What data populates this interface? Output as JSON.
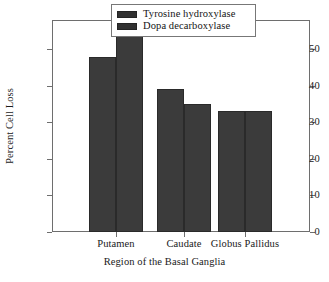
{
  "chart_data": {
    "type": "bar",
    "title": "",
    "xlabel": "Region of the Basal Ganglia",
    "ylabel": "Percent Cell Loss",
    "categories": [
      "Putamen",
      "Caudate",
      "Globus Pallidus"
    ],
    "series": [
      {
        "name": "Tyrosine hydroxylase",
        "values": [
          48,
          39,
          33
        ],
        "color": "#3b3b3b"
      },
      {
        "name": "Dopa decarboxylase",
        "values": [
          54,
          35,
          33
        ],
        "color": "#3b3b3b"
      }
    ],
    "ylim": [
      0,
      58
    ],
    "yticks": [
      0,
      10,
      20,
      30,
      40,
      50
    ],
    "ytick_labels": [
      "0",
      "10",
      "20",
      "30",
      "40",
      "50"
    ],
    "grid": false,
    "legend_position": "top-right",
    "legend_entries": [
      "Tyrosine hydroxylase",
      "Dopa decarboxylase"
    ]
  }
}
